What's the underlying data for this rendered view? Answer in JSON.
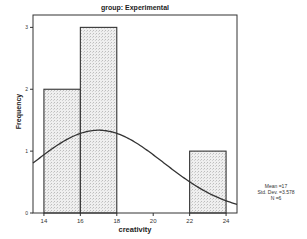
{
  "chart_data": {
    "type": "bar",
    "title": "group: Experimental",
    "xlabel": "creativity",
    "ylabel": "Frequency",
    "bins": [
      {
        "from": 14,
        "to": 16,
        "count": 2
      },
      {
        "from": 16,
        "to": 18,
        "count": 3
      },
      {
        "from": 18,
        "to": 20,
        "count": 0
      },
      {
        "from": 20,
        "to": 22,
        "count": 0
      },
      {
        "from": 22,
        "to": 24,
        "count": 1
      }
    ],
    "categories": [
      "14-16",
      "16-18",
      "18-20",
      "20-22",
      "22-24"
    ],
    "values": [
      2,
      3,
      0,
      0,
      1
    ],
    "x_ticks": [
      14,
      16,
      18,
      20,
      22,
      24
    ],
    "y_ticks": [
      0,
      1,
      2,
      3
    ],
    "xlim": [
      13.4,
      24.6
    ],
    "ylim": [
      0,
      3.2
    ],
    "normal_curve": {
      "mean": 17,
      "std_dev": 3.578,
      "n": 6
    },
    "grid": false
  },
  "stats": {
    "mean": "Mean =17",
    "std_dev": "Std. Dev. =3.578",
    "n": "N =6"
  }
}
